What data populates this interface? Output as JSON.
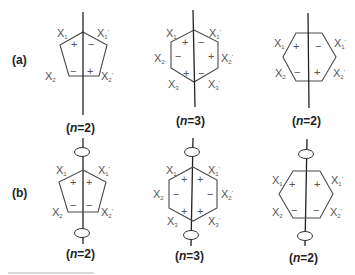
{
  "figure": {
    "panels": [
      {
        "id": "a",
        "label": "(a)",
        "diagrams": [
          {
            "shape": "pentagon",
            "n_label_open": "(",
            "n_var": "n",
            "n_label_rest": "=2)",
            "vertices": {
              "X1": {
                "base": "X",
                "sub": "1",
                "prime": ""
              },
              "X1p": {
                "base": "X",
                "sub": "1",
                "prime": "'"
              },
              "X2": {
                "base": "X",
                "sub": "2",
                "prime": ""
              },
              "X2p": {
                "base": "X",
                "sub": "2",
                "prime": "'"
              }
            },
            "signs": {
              "upper_left": "+",
              "upper_right": "−",
              "lower_left": "−",
              "lower_right": "+"
            }
          },
          {
            "shape": "hexagon-pointy",
            "n_label_open": "(",
            "n_var": "n",
            "n_label_rest": "=3)",
            "vertices": {
              "X1": {
                "base": "X",
                "sub": "1",
                "prime": ""
              },
              "X1p": {
                "base": "X",
                "sub": "1",
                "prime": "'"
              },
              "X2": {
                "base": "X",
                "sub": "2",
                "prime": ""
              },
              "X2p": {
                "base": "X",
                "sub": "2",
                "prime": "'"
              },
              "X3": {
                "base": "X",
                "sub": "3",
                "prime": ""
              },
              "X3p": {
                "base": "X",
                "sub": "3",
                "prime": "'"
              }
            },
            "signs": {
              "top_left": "+",
              "top_right": "−",
              "mid_left": "−",
              "mid_right": "+",
              "bottom_left": "+",
              "bottom_right": "−"
            }
          },
          {
            "shape": "hexagon-flat",
            "n_label_open": "(",
            "n_var": "n",
            "n_label_rest": "=2)",
            "vertices": {
              "X1": {
                "base": "X",
                "sub": "1",
                "prime": ""
              },
              "X1p": {
                "base": "X",
                "sub": "1",
                "prime": "'"
              },
              "X2": {
                "base": "X",
                "sub": "2",
                "prime": ""
              },
              "X2p": {
                "base": "X",
                "sub": "2",
                "prime": "'"
              }
            },
            "signs": {
              "upper_left": "+",
              "upper_right": "−",
              "lower_left": "−",
              "lower_right": "+"
            }
          }
        ]
      },
      {
        "id": "b",
        "label": "(b)",
        "diagrams": [
          {
            "shape": "pentagon",
            "n_label_open": "(",
            "n_var": "n",
            "n_label_rest": "=2)",
            "vertices": {
              "X1": {
                "base": "X",
                "sub": "1",
                "prime": ""
              },
              "X1p": {
                "base": "X",
                "sub": "1",
                "prime": "'"
              },
              "X2": {
                "base": "X",
                "sub": "2",
                "prime": ""
              },
              "X2p": {
                "base": "X",
                "sub": "2",
                "prime": "'"
              }
            },
            "signs": {
              "upper_left": "+",
              "upper_right": "+",
              "lower_left": "−",
              "lower_right": "−"
            }
          },
          {
            "shape": "hexagon-pointy",
            "n_label_open": "(",
            "n_var": "n",
            "n_label_rest": "=3)",
            "vertices": {
              "X1": {
                "base": "X",
                "sub": "1",
                "prime": ""
              },
              "X1p": {
                "base": "X",
                "sub": "1",
                "prime": "'"
              },
              "X2": {
                "base": "X",
                "sub": "2",
                "prime": ""
              },
              "X2p": {
                "base": "X",
                "sub": "2",
                "prime": "'"
              },
              "X3": {
                "base": "X",
                "sub": "3",
                "prime": ""
              },
              "X3p": {
                "base": "X",
                "sub": "3",
                "prime": "'"
              }
            },
            "signs": {
              "top_left": "+",
              "top_right": "+",
              "mid_left": "−",
              "mid_right": "−",
              "bottom_left": "+",
              "bottom_right": "+"
            }
          },
          {
            "shape": "hexagon-flat",
            "n_label_open": "(",
            "n_var": "n",
            "n_label_rest": "=2)",
            "vertices": {
              "X1": {
                "base": "X",
                "sub": "1",
                "prime": ""
              },
              "X1p": {
                "base": "X",
                "sub": "1",
                "prime": "'"
              },
              "X2": {
                "base": "X",
                "sub": "2",
                "prime": ""
              },
              "X2p": {
                "base": "X",
                "sub": "2",
                "prime": "'"
              }
            },
            "signs": {
              "upper_left": "+",
              "upper_right": "+",
              "lower_left": "−",
              "lower_right": "−"
            }
          }
        ]
      }
    ]
  }
}
